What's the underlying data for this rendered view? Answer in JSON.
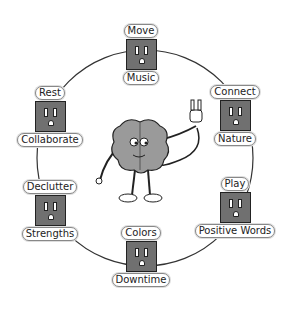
{
  "diagram": {
    "center_figure": "brain character holding a plug",
    "nodes": [
      {
        "id": "top",
        "top_label": "Move",
        "bottom_label": "Music",
        "x": 140,
        "y": 24
      },
      {
        "id": "upper-right",
        "top_label": "Connect",
        "bottom_label": "Nature",
        "x": 235,
        "y": 85
      },
      {
        "id": "lower-right",
        "top_label": "Play",
        "bottom_label": "Positive Words",
        "x": 235,
        "y": 177
      },
      {
        "id": "bottom",
        "top_label": "Colors",
        "bottom_label": "Downtime",
        "x": 140,
        "y": 226
      },
      {
        "id": "lower-left",
        "top_label": "Declutter",
        "bottom_label": "Strengths",
        "x": 50,
        "y": 180
      },
      {
        "id": "upper-left",
        "top_label": "Rest",
        "bottom_label": "Collaborate",
        "x": 50,
        "y": 86
      }
    ],
    "colors": {
      "outlet": "#707070",
      "brain": "#9a9a9a",
      "line": "#333333"
    }
  }
}
